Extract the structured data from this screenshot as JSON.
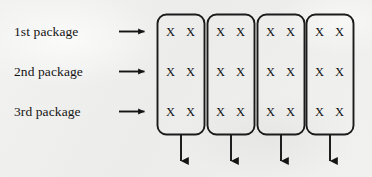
{
  "figure": {
    "type": "diagram",
    "background_color": "#efefee",
    "ink_color": "#141414"
  },
  "row_labels": [
    {
      "text": "1st package",
      "arrow": "right-arrow-icon"
    },
    {
      "text": "2nd package",
      "arrow": "right-arrow-icon"
    },
    {
      "text": "3rd package",
      "arrow": "right-arrow-icon"
    }
  ],
  "columns": [
    {
      "index": 1,
      "cells": [
        [
          "X",
          "X"
        ],
        [
          "X",
          "X"
        ],
        [
          "X",
          "X"
        ]
      ],
      "output_arrow": "down-arrow-icon"
    },
    {
      "index": 2,
      "cells": [
        [
          "X",
          "X"
        ],
        [
          "X",
          "X"
        ],
        [
          "X",
          "X"
        ]
      ],
      "output_arrow": "down-arrow-icon"
    },
    {
      "index": 3,
      "cells": [
        [
          "X",
          "X"
        ],
        [
          "X",
          "X"
        ],
        [
          "X",
          "X"
        ]
      ],
      "output_arrow": "down-arrow-icon"
    },
    {
      "index": 4,
      "cells": [
        [
          "X",
          "X"
        ],
        [
          "X",
          "X"
        ],
        [
          "X",
          "X"
        ]
      ],
      "output_arrow": "down-arrow-icon"
    }
  ],
  "cell_mark": "X",
  "counts": {
    "rows": 3,
    "columns": 4,
    "marks_per_cell": 2
  }
}
